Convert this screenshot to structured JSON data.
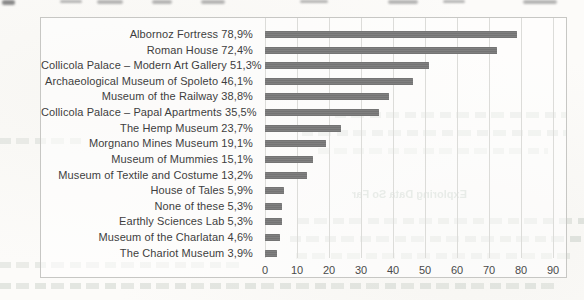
{
  "chart_data": {
    "type": "bar",
    "orientation": "horizontal",
    "title": "",
    "xlabel": "",
    "ylabel": "",
    "categories": [
      "Albornoz Fortress",
      "Roman House",
      "Collicola Palace – Modern Art Gallery",
      "Archaeological Museum of Spoleto",
      "Museum of the Railway",
      "Collicola Palace – Papal Apartments",
      "The Hemp Museum",
      "Morgnano Mines Museum",
      "Museum of Mummies",
      "Museum of Textile and Costume",
      "House of Tales",
      "None of these",
      "Earthly Sciences Lab",
      "Museum of the Charlatan",
      "The Chariot Museum"
    ],
    "values": [
      78.9,
      72.4,
      51.3,
      46.1,
      38.8,
      35.5,
      23.7,
      19.1,
      15.1,
      13.2,
      5.9,
      5.3,
      5.3,
      4.6,
      3.9
    ],
    "value_labels": [
      "78,9%",
      "72,4%",
      "51,3%",
      "46,1%",
      "38,8%",
      "35,5%",
      "23,7%",
      "19,1%",
      "15,1%",
      "13,2%",
      "5,9%",
      "5,3%",
      "5,3%",
      "4,6%",
      "3,9%"
    ],
    "xlim": [
      0,
      90
    ],
    "x_ticks": [
      0,
      10,
      20,
      30,
      40,
      50,
      60,
      70,
      80,
      90
    ],
    "grid": "vertical",
    "legend": "none",
    "bar_color": "#7a7a7a",
    "gridline_color": "#dcdcd9",
    "label_color": "#3e3e3e"
  },
  "page": {
    "show_through_heading": "Exploring Data So Far"
  }
}
